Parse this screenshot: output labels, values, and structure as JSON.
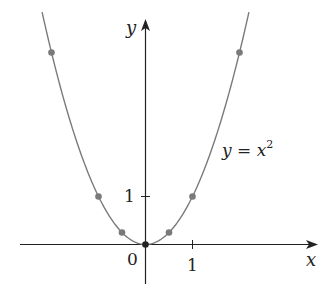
{
  "chart_data": {
    "type": "line",
    "title": "",
    "xlabel": "x",
    "ylabel": "y",
    "curve_label": "y = x",
    "curve_label_exponent": "2",
    "equation": "y = x^2",
    "x_ticks": [
      {
        "value": 1,
        "label": "1"
      }
    ],
    "y_ticks": [
      {
        "value": 1,
        "label": "1"
      }
    ],
    "origin_label": "0",
    "xlim": [
      -2.65,
      3.7
    ],
    "ylim": [
      -0.8,
      4.7
    ],
    "grid": false,
    "legend": "none",
    "series": [
      {
        "name": "y = x^2",
        "kind": "curve",
        "x_range": [
          -2.2,
          2.2
        ],
        "color": "#7a7a7a"
      },
      {
        "name": "points",
        "kind": "scatter",
        "x": [
          -2,
          -1,
          -0.5,
          0,
          0.5,
          1,
          2
        ],
        "y": [
          4,
          1,
          0.25,
          0,
          0.25,
          1,
          4
        ],
        "color": "#7a7a7a",
        "origin_color": "#222222"
      }
    ]
  },
  "colors": {
    "axis": "#222222",
    "curve": "#7a7a7a",
    "point": "#7a7a7a",
    "origin_point": "#222222"
  }
}
